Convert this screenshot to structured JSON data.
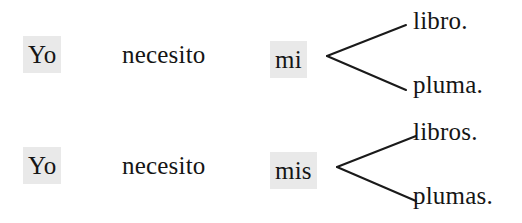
{
  "diagram": {
    "type": "branching-sentence-diagram",
    "language": "Spanish",
    "background_color": "#ffffff",
    "text_color": "#151515",
    "highlight_color": "#e9e9e9",
    "line_color": "#1a1a1a",
    "rows": [
      {
        "subject": "Yo",
        "verb": "necesito",
        "possessive": "mi",
        "branches": [
          "libro.",
          "pluma."
        ]
      },
      {
        "subject": "Yo",
        "verb": "necesito",
        "possessive": "mis",
        "branches": [
          "libros.",
          "plumas."
        ]
      }
    ]
  }
}
